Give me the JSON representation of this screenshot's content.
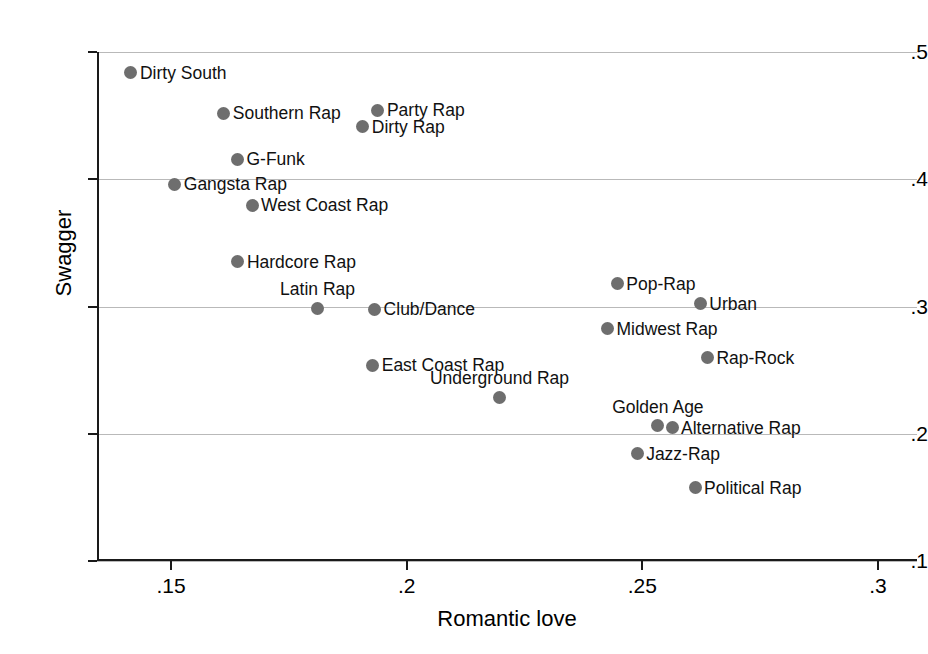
{
  "chart_data": {
    "type": "scatter",
    "title": "",
    "xlabel": "Romantic love",
    "ylabel": "Swagger",
    "xlim": [
      0.1365,
      0.3102
    ],
    "ylim": [
      0.0937,
      0.5
    ],
    "xticks": [
      0.15,
      0.2,
      0.25,
      0.3
    ],
    "xticklabels": [
      ".15",
      ".2",
      ".25",
      ".3"
    ],
    "yticks": [
      0.1,
      0.2,
      0.3,
      0.4,
      0.5
    ],
    "yticklabels": [
      ".1",
      ".2",
      ".3",
      ".4",
      ".5"
    ],
    "grid": "horizontal",
    "legend": "none",
    "marker_color": "#6e6e6e",
    "points": [
      {
        "label": "Dirty South",
        "x": 0.1415,
        "y": 0.4835,
        "label_pos": "right"
      },
      {
        "label": "Southern Rap",
        "x": 0.1612,
        "y": 0.452,
        "label_pos": "right"
      },
      {
        "label": "Party Rap",
        "x": 0.1939,
        "y": 0.4544,
        "label_pos": "right"
      },
      {
        "label": "Dirty Rap",
        "x": 0.1907,
        "y": 0.4411,
        "label_pos": "right"
      },
      {
        "label": "G-Funk",
        "x": 0.1641,
        "y": 0.4158,
        "label_pos": "right"
      },
      {
        "label": "Gangsta Rap",
        "x": 0.1508,
        "y": 0.3961,
        "label_pos": "right"
      },
      {
        "label": "West Coast Rap",
        "x": 0.1672,
        "y": 0.3796,
        "label_pos": "right"
      },
      {
        "label": "Hardcore Rap",
        "x": 0.1642,
        "y": 0.335,
        "label_pos": "right"
      },
      {
        "label": "Latin Rap",
        "x": 0.1811,
        "y": 0.2988,
        "label_pos": "above"
      },
      {
        "label": "Club/Dance",
        "x": 0.1932,
        "y": 0.298,
        "label_pos": "right"
      },
      {
        "label": "East Coast Rap",
        "x": 0.1928,
        "y": 0.254,
        "label_pos": "right"
      },
      {
        "label": "Underground Rap",
        "x": 0.2197,
        "y": 0.2288,
        "label_pos": "above"
      },
      {
        "label": "Pop-Rap",
        "x": 0.2447,
        "y": 0.3178,
        "label_pos": "right"
      },
      {
        "label": "Urban",
        "x": 0.2623,
        "y": 0.3021,
        "label_pos": "right"
      },
      {
        "label": "Midwest Rap",
        "x": 0.2426,
        "y": 0.2827,
        "label_pos": "right"
      },
      {
        "label": "Rap-Rock",
        "x": 0.2638,
        "y": 0.2599,
        "label_pos": "right"
      },
      {
        "label": "Golden Age",
        "x": 0.2533,
        "y": 0.2064,
        "label_pos": "above"
      },
      {
        "label": "Alternative Rap",
        "x": 0.2563,
        "y": 0.2048,
        "label_pos": "right"
      },
      {
        "label": "Jazz-Rap",
        "x": 0.2489,
        "y": 0.1844,
        "label_pos": "right"
      },
      {
        "label": "Political Rap",
        "x": 0.2612,
        "y": 0.1577,
        "label_pos": "right"
      }
    ]
  }
}
